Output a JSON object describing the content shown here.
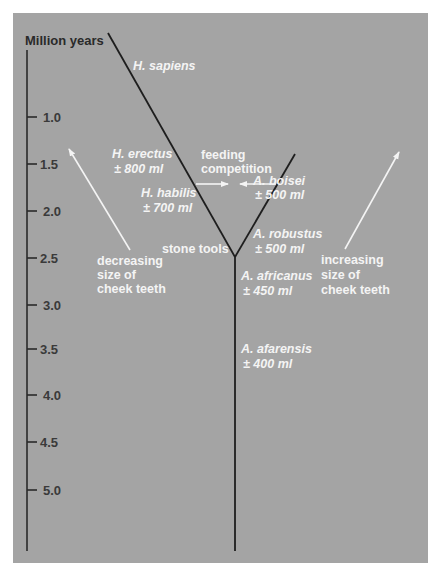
{
  "diagram": {
    "axis": {
      "title": "Million years",
      "ticks": [
        {
          "label": "1.0",
          "y": 117
        },
        {
          "label": "1.5",
          "y": 164
        },
        {
          "label": "2.0",
          "y": 211
        },
        {
          "label": "2.5",
          "y": 258
        },
        {
          "label": "3.0",
          "y": 305
        },
        {
          "label": "3.5",
          "y": 349
        },
        {
          "label": "4.0",
          "y": 395
        },
        {
          "label": "4.5",
          "y": 442
        },
        {
          "label": "5.0",
          "y": 490
        }
      ]
    },
    "species": {
      "h_sapiens": {
        "name": "H. sapiens"
      },
      "h_erectus": {
        "name": "H. erectus",
        "volume": "± 800 ml"
      },
      "h_habilis": {
        "name": "H. habilis",
        "volume": "± 700 ml"
      },
      "a_boisei": {
        "name": "A. boisei",
        "volume": "± 500 ml"
      },
      "a_robustus": {
        "name": "A. robustus",
        "volume": "± 500 ml"
      },
      "a_africanus": {
        "name": "A. africanus",
        "volume": "± 450 ml"
      },
      "a_afarensis": {
        "name": "A. afarensis",
        "volume": "± 400 ml"
      }
    },
    "annotations": {
      "feeding_competition": [
        "feeding",
        "competition"
      ],
      "stone_tools": "stone tools",
      "decreasing": [
        "decreasing",
        "size of",
        "cheek teeth"
      ],
      "increasing": [
        "increasing",
        "size of",
        "cheek teeth"
      ]
    },
    "colors": {
      "panel": "#a4a4a4",
      "lines": "#1e1e1e",
      "label_text": "#f4f4f4",
      "axis_text": "#2a2a2a"
    }
  }
}
